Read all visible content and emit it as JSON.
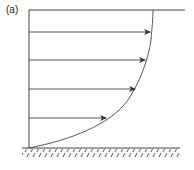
{
  "figure": {
    "label": "(a)",
    "line_color": "#333333",
    "arrows": [
      {
        "y": 32,
        "x_end": 150
      },
      {
        "y": 60,
        "x_end": 145
      },
      {
        "y": 89,
        "x_end": 135
      },
      {
        "y": 118,
        "x_end": 106
      }
    ]
  }
}
